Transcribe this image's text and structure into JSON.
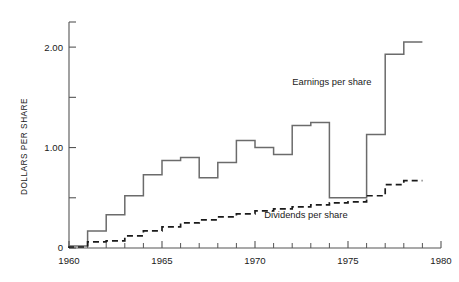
{
  "chart_data": {
    "type": "line",
    "title": "",
    "xlabel": "",
    "ylabel": "DOLLARS PER SHARE",
    "xlim": [
      1960,
      1980
    ],
    "ylim": [
      0,
      2.25
    ],
    "grid": false,
    "legend_position": "inline-annotation",
    "x_ticks_major": [
      1960,
      1965,
      1970,
      1975,
      1980
    ],
    "x_tick_labels": [
      "1960",
      "1965",
      "1970",
      "1975",
      "1980"
    ],
    "x_ticks_minor": [
      1961,
      1962,
      1963,
      1964,
      1966,
      1967,
      1968,
      1969,
      1971,
      1972,
      1973,
      1974,
      1976,
      1977,
      1978,
      1979
    ],
    "y_ticks_major": [
      0,
      1.0,
      2.0
    ],
    "y_tick_labels": [
      "0",
      "1.00",
      "2.00"
    ],
    "y_ticks_minor": [
      0.5,
      1.5
    ],
    "step_style": "post",
    "series": [
      {
        "name": "Earnings per share",
        "style": "solid",
        "color": "#6b6b6b",
        "x": [
          1960,
          1961,
          1962,
          1963,
          1964,
          1965,
          1966,
          1967,
          1968,
          1969,
          1970,
          1971,
          1972,
          1973,
          1974,
          1975,
          1976,
          1977,
          1978
        ],
        "values": [
          0.02,
          0.17,
          0.33,
          0.52,
          0.73,
          0.87,
          0.9,
          0.7,
          0.85,
          1.07,
          1.0,
          0.93,
          1.22,
          1.25,
          0.5,
          0.5,
          1.13,
          1.93,
          2.05
        ]
      },
      {
        "name": "Dividends per share",
        "style": "dashed",
        "color": "#1a1a1a",
        "x": [
          1960,
          1961,
          1962,
          1963,
          1964,
          1965,
          1966,
          1967,
          1968,
          1969,
          1970,
          1971,
          1972,
          1973,
          1974,
          1975,
          1976,
          1977,
          1978
        ],
        "values": [
          0.01,
          0.06,
          0.07,
          0.12,
          0.17,
          0.21,
          0.25,
          0.28,
          0.31,
          0.34,
          0.37,
          0.39,
          0.41,
          0.43,
          0.45,
          0.46,
          0.52,
          0.63,
          0.67
        ]
      }
    ],
    "annotations": [
      {
        "text": "Earnings per share",
        "x": 1972.0,
        "y": 1.62
      },
      {
        "text": "Dividends per share",
        "x": 1970.5,
        "y": 0.3
      }
    ]
  },
  "axis": {
    "y_title": "DOLLARS PER SHARE",
    "y_labels": [
      "2.00",
      "1.00",
      "0"
    ],
    "x_labels": [
      "1960",
      "1965",
      "1970",
      "1975",
      "1980"
    ]
  },
  "labels": {
    "earnings": "Earnings per share",
    "dividends": "Dividends per share"
  },
  "colors": {
    "earnings_line": "#6b6b6b",
    "dividends_line": "#1a1a1a",
    "axis": "#555555",
    "text": "#1a1a1a",
    "background": "#ffffff"
  }
}
